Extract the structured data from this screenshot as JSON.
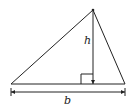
{
  "diagram": {
    "type": "triangle-area",
    "labels": {
      "height": "h",
      "base": "b"
    },
    "colors": {
      "stroke": "#222222",
      "background": "#ffffff"
    }
  }
}
